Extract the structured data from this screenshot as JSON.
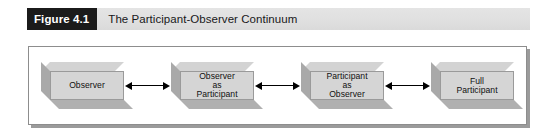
{
  "figure": {
    "badge_label": "Figure 4.1",
    "title": "The Participant-Observer Continuum"
  },
  "colors": {
    "caption_bar_bg": "#e0e0e0",
    "badge_bg": "#1b1b1b",
    "badge_text": "#ffffff",
    "title_text": "#18181a",
    "frame_border": "#8d8d8d",
    "frame_bg": "#ffffff",
    "node_front": "#d5d5d5",
    "node_top": "#d3d3d3",
    "node_side": "#a9a9a9",
    "node_bottom": "#b0b0b0",
    "node_border": "#9a9a9a",
    "arrow": "#000000"
  },
  "diagram": {
    "type": "flow-continuum",
    "orientation": "horizontal",
    "nodes": [
      {
        "id": "observer",
        "label": "Observer"
      },
      {
        "id": "observer-as-participant",
        "label": "Observer\nas\nParticipant"
      },
      {
        "id": "participant-as-observer",
        "label": "Participant\nas\nObserver"
      },
      {
        "id": "full-participant",
        "label": "Full\nParticipant"
      }
    ],
    "connectors": [
      {
        "id": "connector-1",
        "from": "observer",
        "to": "observer-as-participant",
        "style": "double-headed-arrow"
      },
      {
        "id": "connector-2",
        "from": "observer-as-participant",
        "to": "participant-as-observer",
        "style": "double-headed-arrow"
      },
      {
        "id": "connector-3",
        "from": "participant-as-observer",
        "to": "full-participant",
        "style": "double-headed-arrow"
      }
    ]
  }
}
